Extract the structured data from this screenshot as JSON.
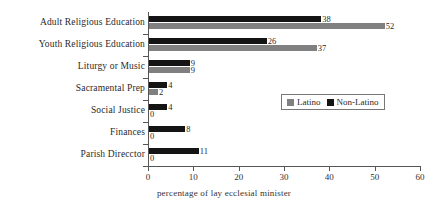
{
  "chart_data": {
    "type": "bar",
    "orientation": "horizontal",
    "title": "",
    "xlabel": "percentage of lay ecclesial minister",
    "ylabel": "",
    "xlim": [
      0,
      60
    ],
    "xticks": [
      0,
      10,
      20,
      30,
      40,
      50,
      60
    ],
    "grid": false,
    "legend_position": "center-right",
    "categories": [
      "Adult Religious Education",
      "Youth Religious Education",
      "Liturgy or Music",
      "Sacramental Prep",
      "Social Justice",
      "Finances",
      "Parish Direcctor"
    ],
    "series": [
      {
        "name": "Non-Latino",
        "color": "#141414",
        "values": [
          38,
          26,
          9,
          4,
          4,
          8,
          11
        ]
      },
      {
        "name": "Latino",
        "color": "#808080",
        "values": [
          52,
          37,
          9,
          2,
          0,
          0,
          0
        ]
      }
    ]
  },
  "legend": {
    "items": [
      {
        "label": "Latino",
        "swatch": "gray-square-icon"
      },
      {
        "label": "Non-Latino",
        "swatch": "black-square-icon"
      }
    ]
  }
}
